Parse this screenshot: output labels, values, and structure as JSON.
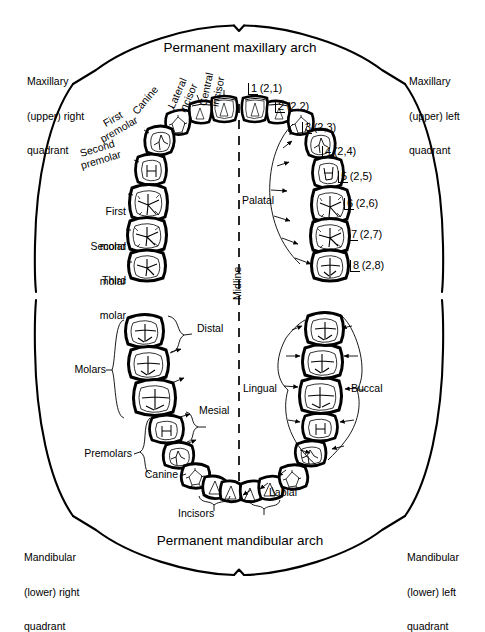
{
  "diagram": {
    "title_top": "Permanent maxillary arch",
    "title_bottom": "Permanent mandibular arch",
    "midline_label": "Midline",
    "line_color": "#000000",
    "background": "#ffffff"
  },
  "quadrants": [
    {
      "id": "maxillary-upper-right",
      "lines": [
        "Maxillary",
        "(upper) right",
        "quadrant"
      ]
    },
    {
      "id": "maxillary-upper-left",
      "lines": [
        "Maxillary",
        "(upper) left",
        "quadrant"
      ]
    },
    {
      "id": "mandibular-lower-right",
      "lines": [
        "Mandibular",
        "(lower) right",
        "quadrant"
      ]
    },
    {
      "id": "mandibular-lower-left",
      "lines": [
        "Mandibular",
        "(lower) left",
        "quadrant"
      ]
    }
  ],
  "maxillary_right_tooth_names": [
    {
      "id": "central-incisor",
      "lines": [
        "Central",
        "incisor"
      ]
    },
    {
      "id": "lateral-incisor",
      "lines": [
        "Lateral",
        "incisor"
      ]
    },
    {
      "id": "canine",
      "lines": [
        "Canine"
      ]
    },
    {
      "id": "first-premolar",
      "lines": [
        "First",
        "premolar"
      ]
    },
    {
      "id": "second-premolar",
      "lines": [
        "Second",
        "premolar"
      ]
    },
    {
      "id": "first-molar",
      "lines": [
        "First",
        "molar"
      ]
    },
    {
      "id": "second-molar",
      "lines": [
        "Second",
        "molar"
      ]
    },
    {
      "id": "third-molar",
      "lines": [
        "Third",
        "molar"
      ]
    }
  ],
  "maxillary_left_tooth_numbers": [
    {
      "number": "1",
      "fdi": "(2,1)"
    },
    {
      "number": "2",
      "fdi": "(2,2)"
    },
    {
      "number": "3",
      "fdi": "(2,3)"
    },
    {
      "number": "4",
      "fdi": "(2,4)"
    },
    {
      "number": "5",
      "fdi": "(2,5)"
    },
    {
      "number": "6",
      "fdi": "(2,6)"
    },
    {
      "number": "7",
      "fdi": "(2,7)"
    },
    {
      "number": "8",
      "fdi": "(2,8)"
    }
  ],
  "surface_labels": {
    "palatal": "Palatal",
    "lingual": "Lingual",
    "buccal": "Buccal",
    "labial": "Labial",
    "mesial": "Mesial",
    "distal": "Distal"
  },
  "mandibular_group_labels": {
    "molars": "Molars",
    "premolars": "Premolars",
    "canine": "Canine",
    "incisors": "Incisors"
  }
}
